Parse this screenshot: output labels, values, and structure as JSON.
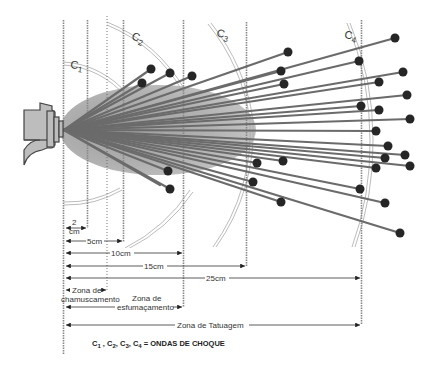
{
  "diagram": {
    "shock_waves": [
      {
        "id": "c1",
        "label": "C",
        "sub": "1"
      },
      {
        "id": "c2",
        "label": "C",
        "sub": "2"
      },
      {
        "id": "c3",
        "label": "C",
        "sub": "3"
      },
      {
        "id": "c4",
        "label": "C",
        "sub": "4"
      }
    ],
    "distances": [
      {
        "label": "2 cm",
        "line1": "2",
        "line2": "cm"
      },
      {
        "label": "5cm"
      },
      {
        "label": "10cm"
      },
      {
        "label": "15cm"
      },
      {
        "label": "25cm"
      }
    ],
    "zones": {
      "chamuscamento": {
        "line1": "Zona de",
        "line2": "chamuscamento"
      },
      "esfumacamento": {
        "line1": "Zona de",
        "line2": "esfumaçamento"
      },
      "tatuagem": {
        "label": "Zona de Tatuagem"
      }
    },
    "legend": {
      "parts": [
        "C",
        "1",
        " , ",
        "C",
        "2",
        ", ",
        "C",
        "3",
        ", ",
        "C",
        "4"
      ],
      "c1": "C",
      "s1": "1",
      "c2": "C",
      "s2": "2",
      "c3": "C",
      "s3": "3",
      "c4": "C",
      "s4": "4",
      "text": "= ONDAS DE CHOQUE"
    },
    "colors": {
      "line": "#777777",
      "pellet": "#2a2a2a",
      "smoke": "#9a9a9a",
      "gun_fill": "#bdbdbd",
      "gun_stroke": "#444444"
    }
  }
}
